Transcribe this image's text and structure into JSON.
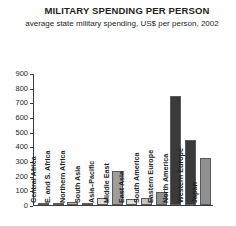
{
  "chart_data": {
    "type": "bar",
    "title": "MILITARY SPENDING PER PERSON",
    "subtitle": "average state military spending, US$ per person, 2002",
    "xlabel": "",
    "ylabel": "",
    "ylim": [
      0,
      900
    ],
    "yticks": [
      0,
      100,
      200,
      300,
      400,
      500,
      600,
      700,
      800,
      900
    ],
    "ytick_labels": [
      "0",
      "100",
      "200",
      "300",
      "400",
      "500",
      "600",
      "700",
      "800",
      "900"
    ],
    "grid": false,
    "legend": "none",
    "categories": [
      "Central Africa",
      "E. and S. Africa",
      "Northern Africa",
      "South Asia",
      "Asia–Pacific",
      "Middle East",
      "East Asia",
      "South America",
      "Eastern Europe",
      "North America",
      "Western Europe",
      "Japan"
    ],
    "values": [
      8,
      10,
      18,
      10,
      45,
      235,
      40,
      45,
      90,
      750,
      450,
      325
    ],
    "bar_colors": [
      "#8c8c8c",
      "#9a9a9a",
      "#b5b5b5",
      "#a8a8a8",
      "#dcdcdc",
      "#9e9e9e",
      "#dcdcdc",
      "#c4c4c4",
      "#8f8f8f",
      "#3a3a3a",
      "#3a3a3a",
      "#8f8f8f"
    ]
  },
  "colors": {
    "axis": "#3a3a3a",
    "text": "#231f20",
    "background": "#ffffff"
  }
}
